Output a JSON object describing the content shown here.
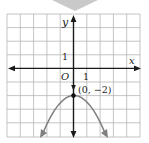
{
  "figure": {
    "type": "coordinate-graph",
    "top_marker": {
      "icon": "chevron-down-icon",
      "color": "#c9c9c9"
    },
    "grid": {
      "color": "#b5b5b5",
      "columns": 10,
      "rows": 9,
      "x_range": [
        -5,
        5
      ],
      "y_range": [
        -5,
        4
      ]
    },
    "axes": {
      "x_label": "x",
      "y_label": "y",
      "origin_label": "O",
      "x_tick_label": "1",
      "y_tick_label": "1",
      "color": "#1a1a1a"
    },
    "curve": {
      "equation_form": "parabola opening downward",
      "color": "#808080",
      "vertex": {
        "x": 0,
        "y": -2
      },
      "vertex_label": "(0, −2)",
      "vertex_color": "#111111"
    }
  }
}
